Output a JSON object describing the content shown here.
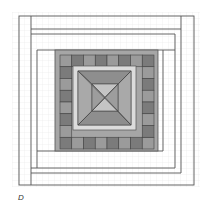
{
  "figure": {
    "label": "D"
  },
  "colors": {
    "grid": "#e6e6e6",
    "line": "#555555",
    "band": "#a6a6a6",
    "square_dark": "#7b7b7b",
    "square_mid": "#9b9b9b",
    "inner_frame": "#dcdcdc",
    "trap_tb": "#8e8e8e",
    "trap_lr": "#a9a9a9",
    "center_tb": "#c4c4c4",
    "center_lr": "#9d9d9d"
  }
}
